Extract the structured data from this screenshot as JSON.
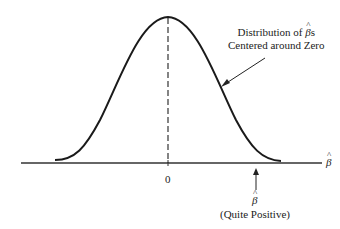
{
  "figure": {
    "annotation": {
      "line1": "Distribution of",
      "symbol": "β",
      "line1_suffix": "s",
      "line2": "Centered around Zero"
    },
    "axis_label_symbol": "β",
    "zero_tick_label": "0",
    "estimate_marker": {
      "symbol": "β",
      "caption": "(Quite Positive)"
    },
    "colors": {
      "curve": "#1a1a1a",
      "axis": "#333333",
      "background": "#ffffff"
    }
  }
}
